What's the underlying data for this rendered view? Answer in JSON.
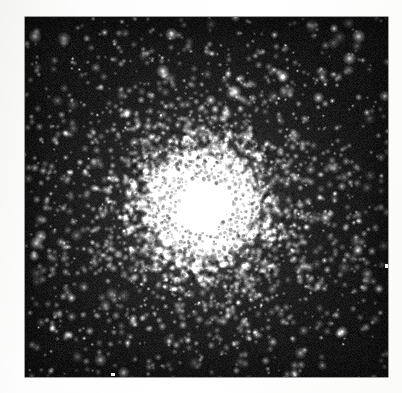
{
  "page": {
    "width": 402,
    "height": 393,
    "background_color": "#ffffff",
    "margin_color": "#fbfbfa",
    "caption": "",
    "title": ""
  },
  "photograph": {
    "subject": "globular star cluster",
    "medium": "black-and-white astronomical photographic plate (halftone scan)",
    "alt_text": "Black and white astronomical photograph of a globular star cluster: a dense, saturated white core surrounded by thousands of resolved stars thinning outward into a dark, grainy sky background.",
    "plate": {
      "x": 25,
      "y": 17,
      "width": 363,
      "height": 360,
      "sky_color": "#0b0b0b",
      "star_color": "#ffffff",
      "border_color": "#3a3a3a"
    },
    "cluster": {
      "center_x": 178,
      "center_y": 190,
      "saturated_core_radius": 23,
      "bright_halo_radius": 62,
      "resolved_halo_radius": 148,
      "core_color": "#ffffff",
      "halo_color": "#d8d8d8"
    }
  },
  "chart_data": {
    "type": "scatter",
    "xlabel": "",
    "ylabel": "",
    "legend": [],
    "annotations": [],
    "grid": false,
    "xlim": [
      0,
      363
    ],
    "ylim": [
      0,
      360
    ],
    "radial_profile": {
      "radius_px": [
        0,
        20,
        30,
        45,
        60,
        80,
        100,
        125,
        150,
        180,
        220,
        260
      ],
      "relative_surface_density": [
        1.0,
        1.0,
        0.82,
        0.55,
        0.36,
        0.21,
        0.13,
        0.075,
        0.042,
        0.022,
        0.012,
        0.008
      ]
    },
    "counts": {
      "core_saturated_pixels": 1600,
      "resolved_cluster_stars": 2400,
      "field_stars": 420
    },
    "center": {
      "x": 178,
      "y": 190
    }
  },
  "render": {
    "seed": 20240817,
    "grain_amplitude": 22,
    "halftone_period": 3,
    "background_level": 11
  }
}
